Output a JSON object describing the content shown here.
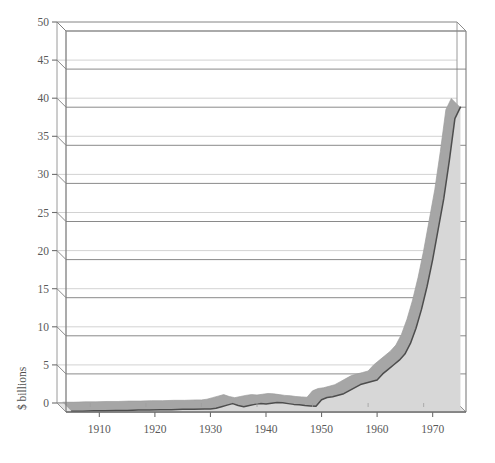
{
  "figure": {
    "background_color": "#ffffff",
    "width": 495,
    "height": 463
  },
  "chart_data": {
    "type": "area",
    "title": "",
    "subtitle": "",
    "xlabel": "",
    "ylabel": "$ billions",
    "xlim": [
      1904,
      1976
    ],
    "ylim": [
      0,
      50
    ],
    "grid": true,
    "legend": null,
    "legend_position": "none",
    "style": "3d-perspective-area",
    "colors": {
      "area_fill": "#d7d7d7",
      "ribbon_top": "#a6a6a6",
      "curve_line": "#4d4d4d",
      "gridline_back": "#c6c6c6",
      "gridline_front": "#7d7d7d",
      "axis": "#6e6e6e",
      "text": "#595959",
      "floor": "#e2e2e2"
    },
    "xticks": [
      1910,
      1920,
      1930,
      1940,
      1950,
      1960,
      1970
    ],
    "xtick_labels": [
      "1910",
      "1920",
      "1930",
      "1940",
      "1950",
      "1960",
      "1970"
    ],
    "yticks": [
      0,
      5,
      10,
      15,
      20,
      25,
      30,
      35,
      40,
      45,
      50
    ],
    "ytick_labels": [
      "0",
      "5",
      "10",
      "15",
      "20",
      "25",
      "30",
      "35",
      "40",
      "45",
      "50"
    ],
    "x": [
      1905,
      1907,
      1909,
      1911,
      1913,
      1915,
      1917,
      1919,
      1921,
      1923,
      1925,
      1927,
      1929,
      1930,
      1931,
      1932,
      1933,
      1934,
      1935,
      1936,
      1937,
      1938,
      1939,
      1940,
      1941,
      1942,
      1943,
      1944,
      1945,
      1946,
      1947,
      1948,
      1949,
      1950,
      1951,
      1952,
      1953,
      1954,
      1955,
      1956,
      1957,
      1958,
      1959,
      1960,
      1961,
      1962,
      1963,
      1964,
      1965,
      1966,
      1967,
      1968,
      1969,
      1970,
      1971,
      1972,
      1973,
      1974,
      1975
    ],
    "values": [
      0.1,
      0.1,
      0.15,
      0.15,
      0.2,
      0.2,
      0.25,
      0.25,
      0.3,
      0.3,
      0.35,
      0.35,
      0.4,
      0.4,
      0.5,
      0.7,
      0.9,
      1.1,
      0.85,
      0.7,
      0.85,
      1.0,
      1.1,
      1.05,
      1.15,
      1.25,
      1.2,
      1.1,
      1.0,
      0.95,
      0.85,
      0.8,
      0.75,
      1.6,
      1.9,
      2.0,
      2.2,
      2.4,
      2.8,
      3.2,
      3.6,
      3.8,
      4.0,
      4.2,
      5.0,
      5.6,
      6.2,
      6.8,
      7.6,
      9.0,
      11.0,
      13.5,
      16.5,
      20.0,
      24.0,
      28.0,
      33.0,
      38.5,
      40.0
    ],
    "series": [
      {
        "name": "total",
        "unit": "$ billions",
        "values": [
          0.1,
          0.1,
          0.15,
          0.15,
          0.2,
          0.2,
          0.25,
          0.25,
          0.3,
          0.3,
          0.35,
          0.35,
          0.4,
          0.4,
          0.5,
          0.7,
          0.9,
          1.1,
          0.85,
          0.7,
          0.85,
          1.0,
          1.1,
          1.05,
          1.15,
          1.25,
          1.2,
          1.1,
          1.0,
          0.95,
          0.85,
          0.8,
          0.75,
          1.6,
          1.9,
          2.0,
          2.2,
          2.4,
          2.8,
          3.2,
          3.6,
          3.8,
          4.0,
          4.2,
          5.0,
          5.6,
          6.2,
          6.8,
          7.6,
          9.0,
          11.0,
          13.5,
          16.5,
          20.0,
          24.0,
          28.0,
          33.0,
          38.5,
          40.0
        ]
      }
    ],
    "annotations": []
  }
}
